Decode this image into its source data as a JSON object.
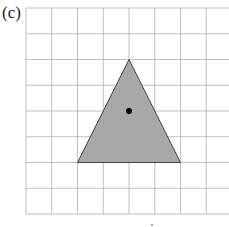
{
  "figure": {
    "label": "(c)",
    "grid": {
      "columns": 8,
      "rows": 8,
      "line_color": "#b0b0b0"
    },
    "shape": {
      "type": "triangle",
      "fill": "#a8a8a8",
      "stroke": "#444444",
      "vertices_grid": [
        [
          4,
          2
        ],
        [
          2,
          6
        ],
        [
          6,
          6
        ]
      ]
    },
    "center_dot": {
      "grid": [
        4,
        4
      ],
      "color": "#000000"
    }
  }
}
